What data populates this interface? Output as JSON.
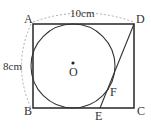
{
  "figure": {
    "points": {
      "A": {
        "label": "A",
        "x": 33,
        "y": 24
      },
      "B": {
        "label": "B",
        "x": 33,
        "y": 108
      },
      "C": {
        "label": "C",
        "x": 134,
        "y": 108
      },
      "D": {
        "label": "D",
        "x": 134,
        "y": 24
      },
      "E": {
        "label": "E",
        "x": 100,
        "y": 108
      },
      "F": {
        "label": "F",
        "x": 110,
        "y": 88
      },
      "O": {
        "label": "O",
        "x": 73,
        "y": 66
      }
    },
    "circle": {
      "center": "O",
      "radius": 42
    },
    "dimensions": {
      "top": "10cm",
      "left": "8cm"
    },
    "colors": {
      "line": "#333333",
      "dashed": "#999999"
    }
  }
}
